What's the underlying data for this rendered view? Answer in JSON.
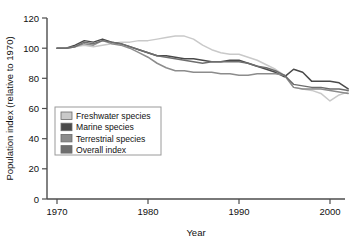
{
  "chart_data": {
    "type": "line",
    "title": "",
    "xlabel": "Year",
    "ylabel": "Population index (relative to 1970)",
    "xlim": [
      1969,
      2002
    ],
    "ylim": [
      0,
      120
    ],
    "xticks": [
      1970,
      1980,
      1990,
      2000
    ],
    "yticks": [
      0,
      20,
      40,
      60,
      80,
      100,
      120
    ],
    "xtick_labels": [
      "1970",
      "1980",
      "1990",
      "2000"
    ],
    "ytick_labels": [
      "0",
      "20",
      "40",
      "60",
      "80",
      "100",
      "120"
    ],
    "grid": false,
    "legend_position": "lower-left-inside",
    "x": [
      1970,
      1971,
      1972,
      1973,
      1974,
      1975,
      1976,
      1977,
      1978,
      1979,
      1980,
      1981,
      1982,
      1983,
      1984,
      1985,
      1986,
      1987,
      1988,
      1989,
      1990,
      1991,
      1992,
      1993,
      1994,
      1995,
      1996,
      1997,
      1998,
      1999,
      2000,
      2001,
      2002
    ],
    "series": [
      {
        "name": "Freshwater species",
        "color": "#c9c9c9",
        "values": [
          100,
          100,
          101,
          102,
          101,
          102,
          103,
          104,
          104,
          105,
          105,
          106,
          107,
          108,
          108,
          106,
          102,
          99,
          97,
          96,
          96,
          94,
          92,
          89,
          86,
          82,
          74,
          73,
          72,
          70,
          65,
          69,
          71
        ]
      },
      {
        "name": "Marine species",
        "color": "#4a4a4a",
        "values": [
          100,
          100,
          102,
          105,
          104,
          106,
          104,
          103,
          101,
          99,
          97,
          95,
          95,
          94,
          93,
          93,
          92,
          91,
          91,
          92,
          92,
          90,
          88,
          86,
          84,
          81,
          86,
          84,
          78,
          78,
          78,
          77,
          73
        ]
      },
      {
        "name": "Terrestrial species",
        "color": "#8c8c8c",
        "values": [
          100,
          100,
          101,
          103,
          102,
          105,
          103,
          102,
          100,
          97,
          94,
          90,
          87,
          85,
          85,
          84,
          84,
          84,
          83,
          83,
          82,
          82,
          83,
          83,
          83,
          82,
          74,
          73,
          73,
          73,
          72,
          71,
          70
        ]
      },
      {
        "name": "Overall index",
        "color": "#6e6e6e",
        "values": [
          100,
          100,
          101,
          104,
          103,
          105,
          104,
          103,
          101,
          99,
          97,
          95,
          94,
          93,
          92,
          91,
          90,
          91,
          91,
          91,
          91,
          90,
          88,
          87,
          85,
          82,
          76,
          75,
          74,
          74,
          73,
          73,
          72
        ]
      }
    ]
  },
  "legend": {
    "items": [
      {
        "label": "Freshwater species"
      },
      {
        "label": "Marine species"
      },
      {
        "label": "Terrestrial species"
      },
      {
        "label": "Overall index"
      }
    ]
  }
}
